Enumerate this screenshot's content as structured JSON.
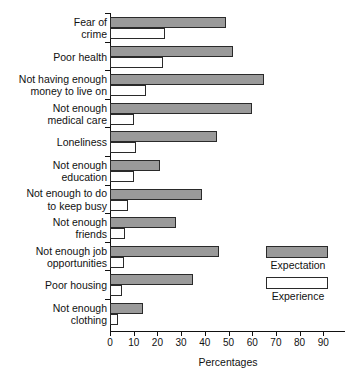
{
  "chart_data": {
    "type": "bar",
    "orientation": "horizontal",
    "title": "",
    "xlabel": "Percentages",
    "ylabel": "",
    "xlim": [
      0,
      98
    ],
    "xticks": [
      0,
      10,
      20,
      30,
      40,
      50,
      60,
      70,
      80,
      90
    ],
    "xtick_labels": [
      "0",
      "10",
      "20",
      "30",
      "40",
      "50",
      "60",
      "70",
      "80",
      "90"
    ],
    "grid": false,
    "legend_position": "right-middle",
    "categories": [
      "Fear of\ncrime",
      "Poor health",
      "Not having enough\nmoney to live on",
      "Not enough\nmedical care",
      "Loneliness",
      "Not enough\neducation",
      "Not enough to do\nto keep busy",
      "Not enough\nfriends",
      "Not enough job\nopportunities",
      "Poor housing",
      "Not enough\nclothing"
    ],
    "category_lines": [
      [
        "Fear of",
        "crime"
      ],
      [
        "Poor health"
      ],
      [
        "Not having enough",
        "money to live on"
      ],
      [
        "Not enough",
        "medical care"
      ],
      [
        "Loneliness"
      ],
      [
        "Not enough",
        "education"
      ],
      [
        "Not enough to do",
        "to keep busy"
      ],
      [
        "Not enough",
        "friends"
      ],
      [
        "Not enough job",
        "opportunities"
      ],
      [
        "Poor housing"
      ],
      [
        "Not enough",
        "clothing"
      ]
    ],
    "series": [
      {
        "name": "Expectation",
        "color": "#9a9a9a",
        "values": [
          49,
          52,
          65,
          60,
          45,
          21,
          39,
          28,
          46,
          35,
          14
        ]
      },
      {
        "name": "Experience",
        "color": "#ffffff",
        "values": [
          23,
          22.5,
          15,
          10,
          11,
          10,
          7.5,
          6.5,
          6,
          5,
          3.5
        ]
      }
    ]
  },
  "legend": {
    "items": [
      {
        "label": "Expectation",
        "swatch": "gray"
      },
      {
        "label": "Experience",
        "swatch": "white"
      }
    ]
  },
  "axis": {
    "x_title": "Percentages"
  }
}
